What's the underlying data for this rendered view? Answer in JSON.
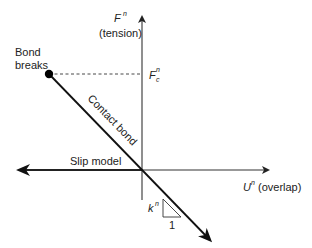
{
  "diagram": {
    "type": "force-displacement",
    "axes": {
      "vertical": {
        "symbol": "F",
        "superscript": "n",
        "label": "(tension)"
      },
      "horizontal": {
        "symbol": "U",
        "superscript": "n",
        "label": "(overlap)"
      }
    },
    "annotations": {
      "bond_breaks": [
        "Bond",
        "breaks"
      ],
      "critical_force": {
        "symbol": "F",
        "superscript": "n",
        "subscript": "c"
      },
      "contact_bond": "Contact bond",
      "slip_model": "Slip model",
      "stiffness": {
        "symbol": "k",
        "superscript": "n"
      },
      "slope_run": "1"
    },
    "colors": {
      "line": "#1a1a1a",
      "axis": "#333333",
      "dashed": "#333333",
      "background": "#ffffff"
    }
  }
}
